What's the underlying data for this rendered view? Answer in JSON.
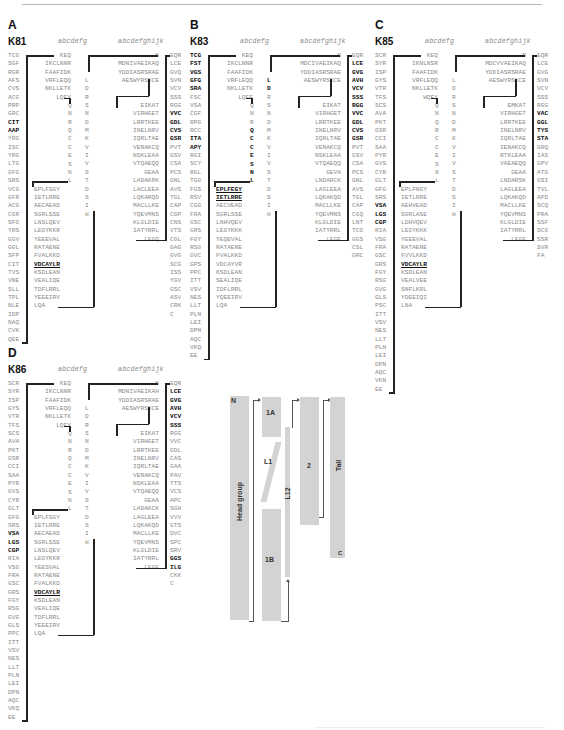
{
  "figure": {
    "heptad_short": "abcdefg",
    "heptad_long": "abcdefghijk"
  },
  "panels": [
    {
      "label": "A",
      "protein": "K81",
      "col_head": [
        "TCG",
        "SGF",
        "RGR",
        "AFS",
        "CVS",
        "ACG",
        "PRP",
        "GRC",
        "CIT",
        "AAP",
        "YRG",
        "ISC",
        "YRG",
        "LTG",
        "GFG",
        "SRS",
        "VCG",
        "GFR",
        "ACG",
        "CGR",
        "SFG",
        "YRS",
        "GGV",
        "GGL",
        "SFP",
        "CIT",
        "TVS",
        "VNE",
        "SLL",
        "TPL",
        "NLE",
        "IDP",
        "NAQ",
        "CVK",
        "QEE"
      ],
      "col_1": [
        "KEQ",
        "IKCLNNR",
        "FAAFIDK",
        "VRFLEQQ",
        "NKLLETK",
        "LQFY"
      ],
      "col_linker1": [
        "Q",
        "N",
        "R",
        "Q",
        "C",
        "C",
        "E",
        "S",
        "N",
        "L"
      ],
      "col_1b": [
        "EPLFSGY",
        "IETLRRE",
        "AECAEAD",
        "SGRLSSE",
        "LNSLQEV",
        "LEGYKKR",
        "YEEEVAL",
        "RATAENE",
        "FVALKKD",
        "VDCAYLR",
        "KSDLEAN",
        "VEALIQE",
        "TDFLRRL",
        "YEEEIRV",
        "LQA"
      ],
      "col_l12": [
        "L",
        "D",
        "R",
        "S",
        "N",
        "D",
        "M",
        "K",
        "V",
        "I",
        "V",
        "S",
        "T",
        "D",
        "S",
        "I",
        "H"
      ],
      "col_2": [
        "N",
        "MDNIVAEIKAQ",
        "YDDIASRSRAE",
        "AESWYRSKCE",
        "",
        "",
        "EIKAT",
        "VIRHGET",
        "LRRTKEE",
        "INELNRV",
        "IQRLTAE",
        "VENAKCQ",
        "NSKLEAA",
        "VTQAEQQ",
        "GEAA",
        "LADAKRK",
        "LACLEEA",
        "LQKARQD",
        "MACLLKE",
        "YQEVMNS",
        "KLGLDIE",
        "IATYRRL",
        "LEGQ"
      ],
      "col_tail": [
        "EQR",
        "LCE",
        "GVQ",
        "SVN",
        "VCV",
        "SSS",
        "RGG",
        "VVC",
        "GDL",
        "CVS",
        "GSR",
        "PVT",
        "GSV",
        "CSA",
        "PCS",
        "GNL",
        "AVS",
        "TGL",
        "CAP",
        "CGP",
        "CNS",
        "VTS",
        "CGL",
        "GAG",
        "GVG",
        "SCG",
        "ISS",
        "YGV",
        "GSC",
        "ASV",
        "CRK",
        "C"
      ]
    },
    {
      "label": "B",
      "protein": "K83",
      "col_head": [
        "TCG",
        "FST",
        "VGS",
        "GFG",
        "SRA",
        "FSC",
        "VSA",
        "CGF",
        "RPG",
        "RCC",
        "ITA",
        "APY",
        "RGI",
        "SCY",
        "RGL",
        "TGG",
        "FGS",
        "RSV",
        "CGG",
        "FRA",
        "GSC",
        "GRS",
        "FGY",
        "RSG",
        "GVC",
        "GPS",
        "PPC",
        "ITT",
        "VSV",
        "NES",
        "LLT",
        "PLN",
        "LEI",
        "DPN",
        "AQC",
        "VKQ",
        "EE"
      ],
      "col_1": [
        "KEQ",
        "IKCLNNR",
        "FAAFIDK",
        "VRFLEQQ",
        "NKLLETK",
        "LQFF"
      ],
      "col_linker1": [
        "Q",
        "N",
        "R",
        "Q",
        "C",
        "C",
        "E",
        "S",
        "N",
        "L"
      ],
      "col_1b": [
        "EPLFEGY",
        "IETLRRE",
        "AECVEAD",
        "SGRLSSE",
        "LNHVQEV",
        "LEGYKKK",
        "YEQEVAL",
        "RATAENE",
        "FVALKKD",
        "VDCAYVR",
        "KSDLEAN",
        "SEALIQE",
        "IDFLRRL",
        "YQEEIRV",
        "LQA"
      ],
      "col_l12": [
        "L",
        "D",
        "R",
        "S",
        "N",
        "D",
        "M",
        "K",
        "V",
        "I",
        "V",
        "S",
        "T",
        "D",
        "S",
        "I",
        "H"
      ],
      "col_2": [
        "N",
        "MDCIVAEIKAQ",
        "YDDIASRSRAE",
        "AESWYRSKCE",
        "",
        "",
        "EIKAT",
        "VIRHGET",
        "LRRTKEE",
        "INELNRV",
        "IQRLTAE",
        "VENAKCQ",
        "NSKLEAA",
        "VTQAEQQ",
        "GEVA",
        "LNDARCK",
        "LAGLEEA",
        "LQKAKQD",
        "MACLLKE",
        "YQEVMNS",
        "KLGLDIE",
        "IATYRRL",
        "LEGE"
      ],
      "col_tail": [
        "EQR",
        "LCE",
        "GVG",
        "AVH",
        "VCV",
        "SSS",
        "RGG",
        "VVC",
        "GDL",
        "CVS",
        "GSR",
        "PVT",
        "GSV",
        "CSA",
        "PCS",
        "GNL",
        "AVS",
        "TGL",
        "CAP",
        "CGQ",
        "LNT",
        "TCG",
        "GGS",
        "CSL",
        "GRC"
      ]
    },
    {
      "label": "C",
      "protein": "K85",
      "col_head": [
        "SCR",
        "SYR",
        "ISP",
        "GYS",
        "VTR",
        "TFS",
        "SCS",
        "AVA",
        "PKT",
        "GSR",
        "CCI",
        "SAA",
        "PYR",
        "GVS",
        "CYR",
        "GLT",
        "GFG",
        "SRS",
        "VSA",
        "LGS",
        "CGP",
        "RIA",
        "VSG",
        "FRA",
        "GSC",
        "GRS",
        "FGY",
        "RSG",
        "GVG",
        "GLS",
        "PSC",
        "ITT",
        "VSV",
        "NES",
        "LLT",
        "PLN",
        "LEI",
        "DPN",
        "AQC",
        "VKN",
        "EE"
      ],
      "col_1": [
        "KEQ",
        "IKNLNSR",
        "FAAFIDK",
        "VRFLEQQ",
        "NKLLETK",
        "WQFY"
      ],
      "col_linker1": [
        "Q",
        "N",
        "Q",
        "R",
        "C",
        "C",
        "E",
        "S",
        "N",
        "L"
      ],
      "col_1b": [
        "EPLFNGY",
        "IETLRRE",
        "AEHVEAD",
        "SGRLASE",
        "LDHVQEV",
        "LEGYKKK",
        "YEEEVAL",
        "RATAENE",
        "FVVLKKD",
        "VDCAYLR",
        "KSDLEAN",
        "VEALVEE",
        "SNFLKRL",
        "YDEEIQI",
        "LNA"
      ],
      "col_l12": [
        "L",
        "D",
        "R",
        "S",
        "N",
        "D",
        "M",
        "K",
        "V",
        "I",
        "V",
        "S",
        "T",
        "D",
        "S",
        "I",
        "H"
      ],
      "col_2": [
        "N",
        "MDCVVAEIKAQ",
        "YDDIASRSRAE",
        "AESWYRSKCE",
        "",
        "",
        "EMKAT",
        "VIRHGET",
        "LRRTKEE",
        "INELNRV",
        "IQRLTAE",
        "IENAKCQ",
        "RTKLEAA",
        "VAEAEQQ",
        "GEAA",
        "LNDARSK",
        "LAGLEEA",
        "LQKAKQD",
        "MACLLKE",
        "YQEVMNS",
        "KLGLDIE",
        "IATYRRL",
        "LEGE"
      ],
      "col_tail": [
        "EQR",
        "LCE",
        "GVG",
        "SVN",
        "VCV",
        "SSS",
        "RGG",
        "VAC",
        "GGL",
        "TYS",
        "STA",
        "GRQ",
        "IAS",
        "GPV",
        "ATG",
        "GSI",
        "TVL",
        "APD",
        "SCQ",
        "PRA",
        "SSF",
        "SCG",
        "SSR",
        "SVR",
        "FA"
      ]
    },
    {
      "label": "D",
      "protein": "K86",
      "col_head": [
        "SCR",
        "SYR",
        "ISP",
        "GYS",
        "VTR",
        "TFS",
        "SCS",
        "AVA",
        "PKT",
        "GSR",
        "CCI",
        "SAA",
        "PYR",
        "GVS",
        "CYR",
        "GLT",
        "GFG",
        "SRS",
        "VSA",
        "LGS",
        "CGP",
        "RIA",
        "VSG",
        "FRA",
        "GSC",
        "GRS",
        "FGY",
        "RSG",
        "GVG",
        "GLS",
        "PPC",
        "ITT",
        "VSV",
        "NES",
        "LLT",
        "PLN",
        "LEI",
        "DPN",
        "AQC",
        "VKQ",
        "EE"
      ],
      "col_1": [
        "KEQ",
        "IKCLNNR",
        "FAAFIDK",
        "VRFLEQQ",
        "NKLLETK",
        "LQFY"
      ],
      "col_linker1": [
        "Q",
        "N",
        "R",
        "Q",
        "C",
        "C",
        "E",
        "S",
        "N",
        "L"
      ],
      "col_1b": [
        "EPLFSGY",
        "IETLRRE",
        "AECAEAD",
        "SGRLSSE",
        "LNSLQEV",
        "LEGYKKR",
        "YEESVAL",
        "RATAENE",
        "FVALKKD",
        "VDCAYLR",
        "KSDLEAN",
        "VEALIQE",
        "TDFLRRL",
        "YEEEIRV",
        "LQA"
      ],
      "col_l12": [
        "L",
        "D",
        "R",
        "S",
        "N",
        "D",
        "M",
        "K",
        "V",
        "I",
        "V",
        "S",
        "T",
        "D",
        "S",
        "I",
        "H"
      ],
      "col_2": [
        "N",
        "MDNIVAEIKAH",
        "YDDIASRSRAE",
        "AESWYRSKCE",
        "",
        "",
        "EIKAT",
        "VIRHGET",
        "LRRTKEE",
        "INELNRV",
        "IQRLTAE",
        "VENAKCQ",
        "NSKLEAA",
        "VTQAEQQ",
        "GEAA",
        "LADAKCK",
        "LAGLEEA",
        "LQKAKQD",
        "MACLLKE",
        "YQEVMNS",
        "KLGLDIE",
        "IATYRRL",
        "LEGE"
      ],
      "col_tail": [
        "EQR",
        "LCE",
        "GVG",
        "AVH",
        "VCV",
        "SSS",
        "RGG",
        "VVC",
        "GDL",
        "CAS",
        "GAA",
        "PAV",
        "TTS",
        "VCS",
        "APC",
        "SGH",
        "VVV",
        "GTS",
        "DVC",
        "SPC",
        "SRV",
        "GGS",
        "ILG",
        "CKK",
        "C"
      ]
    }
  ],
  "diagram": {
    "labels": {
      "n_term": "N",
      "head": "Head group",
      "seg_1a": "1A",
      "linker_1": "L1",
      "seg_1b": "1B",
      "linker_12": "L12",
      "seg_2": "2",
      "tail": "Tail",
      "c_term": "C"
    },
    "box_color": "#d3d3d3"
  }
}
